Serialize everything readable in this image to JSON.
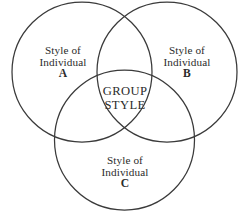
{
  "diagram": {
    "type": "venn-three-circle",
    "background_color": "#ffffff",
    "stroke_color": "#3a3a3a",
    "text_color": "#2b2b2b",
    "circles": [
      {
        "id": "A",
        "position": "left",
        "cx": 82,
        "cy": 72,
        "r": 70
      },
      {
        "id": "B",
        "position": "right",
        "cx": 167,
        "cy": 72,
        "r": 70
      },
      {
        "id": "C",
        "position": "bottom",
        "cx": 124.5,
        "cy": 140,
        "r": 70
      }
    ],
    "sets": {
      "a": {
        "line1": "Style of",
        "line2": "Individual",
        "line3": "A"
      },
      "b": {
        "line1": "Style of",
        "line2": "Individual",
        "line3": "B"
      },
      "c": {
        "line1": "Style of",
        "line2": "Individual",
        "line3": "C"
      }
    },
    "intersection": {
      "line1": "GROUP",
      "line2": "STYLE"
    }
  }
}
